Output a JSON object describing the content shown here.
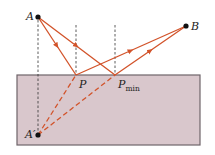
{
  "diagram": {
    "type": "reflection / image-point shortest path",
    "colors": {
      "ray": "#d2532a",
      "medium_fill": "#d9c7cc",
      "medium_border": "#6e6469",
      "guide": "#333333",
      "point": "#111111"
    },
    "points": {
      "A": {
        "label": "A",
        "x": 38,
        "y": 17
      },
      "B": {
        "label": "B",
        "x": 186,
        "y": 26
      },
      "P": {
        "label": "P",
        "x": 76,
        "y": 75
      },
      "Pmin": {
        "label": "P",
        "sub": "min",
        "x": 115,
        "y": 75
      },
      "A_image": {
        "label": "A′",
        "x": 38,
        "y": 135
      }
    },
    "surface": {
      "x": 17,
      "y": 75,
      "width": 183,
      "height": 70
    }
  }
}
